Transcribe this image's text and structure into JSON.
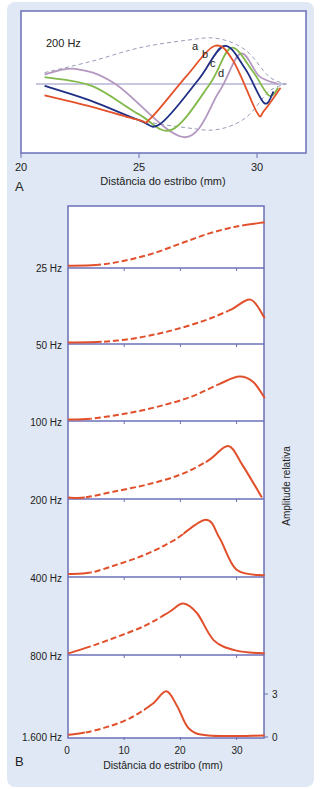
{
  "colors": {
    "background": "#dfe8f4",
    "frame": "#6b70b8",
    "curve_a": "#e5532a",
    "curve_b": "#1f2f86",
    "curve_c": "#82b94a",
    "curve_d": "#b498c0",
    "envelope": "#9a9cb8",
    "baseline": "#8e90c0",
    "response": "#e1502b"
  },
  "panel_a": {
    "letter": "A",
    "frequency_label": "200 Hz",
    "xlabel": "Distância do estribo (mm)",
    "xticks": [
      "20",
      "25",
      "30"
    ],
    "curve_labels": [
      "a",
      "b",
      "c",
      "d"
    ]
  },
  "panel_b": {
    "letter": "B",
    "xlabel": "Distância do estribo (mm)",
    "ylabel": "Amplitude relativa",
    "xticks": [
      "0",
      "10",
      "20",
      "30"
    ],
    "yticks": [
      "3",
      "0"
    ],
    "frequencies": [
      "25 Hz",
      "50 Hz",
      "100 Hz",
      "200 Hz",
      "400 Hz",
      "800 Hz",
      "1.600 Hz"
    ]
  },
  "chart_data": [
    {
      "type": "line",
      "title": "200 Hz",
      "xlabel": "Distância do estribo (mm)",
      "ylabel": "",
      "xlim": [
        20,
        31
      ],
      "grid": false,
      "legend": "inline labels a, b, c, d",
      "series": [
        {
          "name": "a",
          "x": [
            21,
            23,
            25,
            25.5,
            27,
            28.2,
            29,
            30,
            30.3,
            31
          ],
          "y": [
            -0.3,
            -0.6,
            -0.95,
            -0.9,
            0.2,
            1.0,
            0.6,
            -0.75,
            -0.7,
            -0.1
          ]
        },
        {
          "name": "b",
          "x": [
            21,
            23,
            25,
            25.9,
            27.5,
            28.6,
            29.5,
            30.3,
            30.7
          ],
          "y": [
            -0.05,
            -0.45,
            -0.95,
            -1.05,
            0.1,
            1.0,
            0.4,
            -0.5,
            -0.2
          ]
        },
        {
          "name": "c",
          "x": [
            21,
            23,
            25,
            26.4,
            28,
            28.9,
            29.8,
            30.5,
            30.9
          ],
          "y": [
            0.18,
            -0.05,
            -0.8,
            -1.2,
            0.0,
            0.95,
            0.35,
            -0.3,
            -0.1
          ]
        },
        {
          "name": "d",
          "x": [
            21,
            22.3,
            24,
            26.9,
            28.4,
            29.3,
            30.1,
            30.9
          ],
          "y": [
            0.25,
            0.4,
            0.0,
            -1.4,
            -0.2,
            0.8,
            0.2,
            0.0
          ]
        },
        {
          "name": "envelope",
          "x": [
            21,
            23,
            25,
            27,
            28.3,
            29.5,
            30.5,
            31.2
          ],
          "y": [
            0.3,
            0.6,
            0.95,
            1.15,
            1.2,
            0.9,
            0.2,
            0.0
          ]
        }
      ]
    },
    {
      "type": "line",
      "title": "",
      "xlabel": "Distância do estribo (mm)",
      "ylabel": "Amplitude relativa",
      "xlim": [
        0,
        35
      ],
      "ylim_per_panel": [
        0,
        5.4
      ],
      "yticks": [
        0,
        3
      ],
      "grid": false,
      "categories": [
        "25 Hz",
        "50 Hz",
        "100 Hz",
        "200 Hz",
        "400 Hz",
        "800 Hz",
        "1.600 Hz"
      ],
      "series": [
        {
          "name": "25 Hz",
          "peak_mm": 35,
          "peak_amp": 3.1,
          "x": [
            0,
            5,
            10,
            15,
            20,
            25,
            30,
            35
          ],
          "y": [
            0.05,
            0.1,
            0.4,
            0.9,
            1.6,
            2.3,
            2.8,
            3.1
          ]
        },
        {
          "name": "50 Hz",
          "peak_mm": 32.5,
          "peak_amp": 3.0,
          "x": [
            0,
            6,
            12,
            18,
            24,
            29,
            32.5,
            35
          ],
          "y": [
            0.0,
            0.05,
            0.3,
            0.8,
            1.5,
            2.3,
            3.0,
            1.7
          ]
        },
        {
          "name": "100 Hz",
          "peak_mm": 30.5,
          "peak_amp": 3.0,
          "x": [
            0,
            4,
            10,
            16,
            22,
            27,
            30.5,
            33,
            35
          ],
          "y": [
            0.0,
            0.05,
            0.4,
            0.9,
            1.6,
            2.5,
            3.0,
            2.6,
            1.5
          ]
        },
        {
          "name": "200 Hz",
          "peak_mm": 28.5,
          "peak_amp": 3.6,
          "x": [
            0,
            3,
            8,
            14,
            20,
            25,
            28.5,
            31,
            34.5
          ],
          "y": [
            0.0,
            0.0,
            0.4,
            0.9,
            1.6,
            2.6,
            3.6,
            2.3,
            0.0
          ]
        },
        {
          "name": "400 Hz",
          "peak_mm": 24.5,
          "peak_amp": 3.9,
          "x": [
            0,
            4,
            9,
            14,
            19,
            24.5,
            27,
            30,
            35
          ],
          "y": [
            0.1,
            0.2,
            0.8,
            1.5,
            2.5,
            3.9,
            2.6,
            0.4,
            0.0
          ]
        },
        {
          "name": "800 Hz",
          "peak_mm": 20.5,
          "peak_amp": 3.5,
          "x": [
            0,
            4,
            9,
            14,
            18,
            20.5,
            23,
            26,
            30,
            35
          ],
          "y": [
            0.0,
            0.5,
            1.2,
            2.0,
            2.9,
            3.5,
            2.8,
            0.9,
            0.2,
            0.0
          ]
        },
        {
          "name": "1.600 Hz",
          "peak_mm": 17.5,
          "peak_amp": 3.1,
          "x": [
            0,
            3,
            7,
            11,
            15,
            17.5,
            19.5,
            21.5,
            25,
            35
          ],
          "y": [
            0.05,
            0.2,
            0.6,
            1.2,
            2.2,
            3.1,
            2.0,
            0.5,
            0.0,
            0.0
          ]
        }
      ]
    }
  ]
}
